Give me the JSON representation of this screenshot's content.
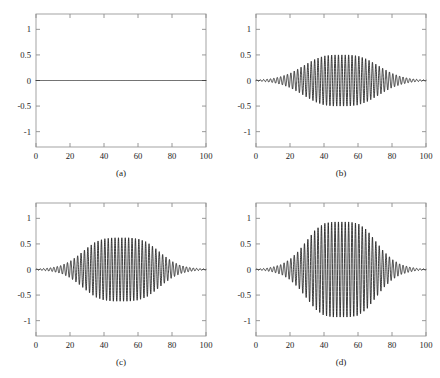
{
  "figure": {
    "title": "",
    "background_color": "#ffffff",
    "line_color": "#161616",
    "frame_color": "#9a9a9a",
    "layout": "2x2 grid of line plots"
  },
  "axes": {
    "x_ticks": [
      0,
      20,
      40,
      60,
      80,
      100
    ],
    "x_tick_labels": [
      "0",
      "20",
      "40",
      "60",
      "80",
      "100"
    ],
    "y_ticks": [
      1,
      0.5,
      0,
      -0.5,
      -1
    ],
    "y_tick_labels": [
      "1",
      "0.5",
      "0",
      "-0.5",
      "-1"
    ],
    "xlim": [
      0,
      100
    ],
    "ylim": [
      -1.3,
      1.3
    ],
    "grid": false,
    "tick_direction": "in"
  },
  "captions": {
    "a": "(a)",
    "b": "(b)",
    "c": "(c)",
    "d": "(d)"
  },
  "chart_data": [
    {
      "type": "line",
      "panel": "a",
      "title": "(a)",
      "xlabel": "",
      "ylabel": "",
      "xlim": [
        0,
        100
      ],
      "ylim": [
        -1.3,
        1.3
      ],
      "grid": false,
      "legend": null,
      "description": "Flat zero signal across the full x range",
      "signal": {
        "model": "constant",
        "amplitude": 0.0,
        "carrier_frequency": 0.0,
        "envelope_center": 50,
        "envelope_width": 0
      },
      "x": [
        0,
        10,
        20,
        30,
        40,
        50,
        60,
        70,
        80,
        90,
        100
      ],
      "values": [
        0,
        0,
        0,
        0,
        0,
        0,
        0,
        0,
        0,
        0,
        0
      ]
    },
    {
      "type": "line",
      "panel": "b",
      "title": "(b)",
      "xlabel": "",
      "ylabel": "",
      "xlim": [
        0,
        100
      ],
      "ylim": [
        -1.3,
        1.3
      ],
      "grid": false,
      "legend": null,
      "description": "Amplitude-modulated sinusoid, bell-shaped envelope peaking near 0.50 at x = 50",
      "signal": {
        "model": "gaussian-modulated sinusoid",
        "amplitude": 0.5,
        "carrier_frequency": 0.5,
        "envelope_center": 50,
        "envelope_width": 21,
        "envelope_shape": "gaussian"
      },
      "x": [
        0,
        5,
        10,
        15,
        20,
        25,
        30,
        35,
        40,
        45,
        50,
        55,
        60,
        65,
        70,
        75,
        80,
        85,
        90,
        95,
        100
      ],
      "envelope": [
        0.01,
        0.02,
        0.04,
        0.08,
        0.14,
        0.23,
        0.33,
        0.42,
        0.48,
        0.5,
        0.5,
        0.5,
        0.48,
        0.42,
        0.33,
        0.23,
        0.14,
        0.08,
        0.04,
        0.02,
        0.01
      ]
    },
    {
      "type": "line",
      "panel": "c",
      "title": "(c)",
      "xlabel": "",
      "ylabel": "",
      "xlim": [
        0,
        100
      ],
      "ylim": [
        -1.3,
        1.3
      ],
      "grid": false,
      "legend": null,
      "description": "Amplitude-modulated sinusoid, bell-shaped envelope peaking near 0.62 at x = 50",
      "signal": {
        "model": "gaussian-modulated sinusoid",
        "amplitude": 0.62,
        "carrier_frequency": 0.5,
        "envelope_center": 50,
        "envelope_width": 19,
        "envelope_shape": "gaussian"
      },
      "x": [
        0,
        5,
        10,
        15,
        20,
        25,
        30,
        35,
        40,
        45,
        50,
        55,
        60,
        65,
        70,
        75,
        80,
        85,
        90,
        95,
        100
      ],
      "envelope": [
        0.01,
        0.02,
        0.04,
        0.08,
        0.16,
        0.28,
        0.42,
        0.54,
        0.6,
        0.62,
        0.62,
        0.62,
        0.6,
        0.54,
        0.42,
        0.28,
        0.16,
        0.08,
        0.04,
        0.02,
        0.01
      ]
    },
    {
      "type": "line",
      "panel": "d",
      "title": "(d)",
      "xlabel": "",
      "ylabel": "",
      "xlim": [
        0,
        100
      ],
      "ylim": [
        -1.3,
        1.3
      ],
      "grid": false,
      "legend": null,
      "description": "Amplitude-modulated sinusoid, bell-shaped envelope peaking near 0.93 at x = 50",
      "signal": {
        "model": "gaussian-modulated sinusoid",
        "amplitude": 0.93,
        "carrier_frequency": 0.5,
        "envelope_center": 50,
        "envelope_width": 17,
        "envelope_shape": "gaussian"
      },
      "x": [
        0,
        5,
        10,
        15,
        20,
        25,
        30,
        35,
        40,
        45,
        50,
        55,
        60,
        65,
        70,
        75,
        80,
        85,
        90,
        95,
        100
      ],
      "envelope": [
        0.01,
        0.02,
        0.05,
        0.1,
        0.2,
        0.36,
        0.57,
        0.78,
        0.9,
        0.93,
        0.93,
        0.93,
        0.9,
        0.78,
        0.57,
        0.36,
        0.2,
        0.1,
        0.05,
        0.02,
        0.01
      ]
    }
  ]
}
